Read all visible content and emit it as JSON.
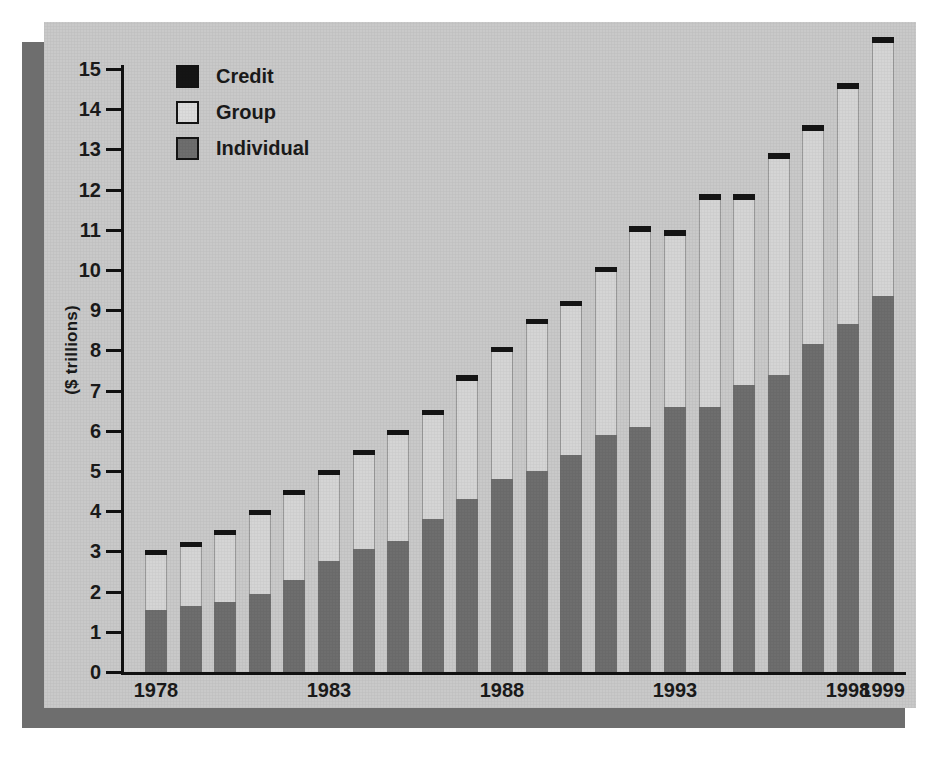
{
  "chart_data": {
    "type": "bar",
    "subtype": "stacked-bar",
    "title": "",
    "xlabel": "",
    "ylabel": "($ trillions)",
    "ylim": [
      0,
      15
    ],
    "ytick_values": [
      0,
      1,
      2,
      3,
      4,
      5,
      6,
      7,
      8,
      9,
      10,
      11,
      12,
      13,
      14,
      15
    ],
    "ytick_labels": [
      "0",
      "1",
      "2",
      "3",
      "4",
      "5",
      "6",
      "7",
      "8",
      "9",
      "10",
      "11",
      "12",
      "13",
      "14",
      "15"
    ],
    "grid": false,
    "legend_position": "upper-left-inside",
    "categories": [
      "1978",
      "1979",
      "1980",
      "1981",
      "1982",
      "1983",
      "1984",
      "1985",
      "1986",
      "1987",
      "1988",
      "1989",
      "1990",
      "1991",
      "1992",
      "1993",
      "1994",
      "1995",
      "1996",
      "1997",
      "1998",
      "1999"
    ],
    "xtick_labels_shown": [
      "1978",
      "1983",
      "1988",
      "1993",
      "1998",
      "1999"
    ],
    "xtick_label_indices": [
      0,
      5,
      10,
      15,
      20,
      21
    ],
    "series": [
      {
        "name": "Individual",
        "color": "#6e6e6e",
        "values": [
          1.55,
          1.65,
          1.75,
          1.95,
          2.3,
          2.75,
          3.05,
          3.25,
          3.8,
          4.3,
          4.8,
          5.0,
          5.4,
          5.9,
          6.1,
          6.6,
          6.6,
          7.15,
          7.4,
          8.15,
          8.65,
          9.35
        ]
      },
      {
        "name": "Group",
        "color": "#d5d5d5",
        "values": [
          1.35,
          1.45,
          1.65,
          1.95,
          2.1,
          2.15,
          2.35,
          2.65,
          2.6,
          2.95,
          3.15,
          3.65,
          3.7,
          4.05,
          4.85,
          4.25,
          5.15,
          4.6,
          5.35,
          5.3,
          5.85,
          6.3
        ]
      },
      {
        "name": "Credit",
        "color": "#151515",
        "values": [
          0.1,
          0.1,
          0.1,
          0.1,
          0.1,
          0.1,
          0.1,
          0.1,
          0.1,
          0.15,
          0.1,
          0.1,
          0.1,
          0.1,
          0.15,
          0.15,
          0.15,
          0.15,
          0.15,
          0.15,
          0.15,
          0.15
        ]
      }
    ],
    "totals": [
      3.0,
      3.2,
      3.5,
      4.0,
      4.5,
      5.0,
      5.5,
      6.0,
      6.5,
      7.4,
      8.05,
      8.75,
      9.2,
      10.05,
      11.1,
      11.0,
      11.9,
      11.9,
      12.9,
      13.6,
      14.65,
      15.8
    ]
  },
  "legend": {
    "items": [
      {
        "label": "Credit",
        "swatch_class": "sw-credit"
      },
      {
        "label": "Group",
        "swatch_class": "sw-group"
      },
      {
        "label": "Individual",
        "swatch_class": "sw-individual"
      }
    ]
  },
  "colors": {
    "panel_background": "#c9c9c9",
    "shadow": "#6e6e6e",
    "axis": "#111111",
    "text": "#1a1a1a",
    "individual": "#6e6e6e",
    "group": "#d5d5d5",
    "credit": "#151515"
  }
}
